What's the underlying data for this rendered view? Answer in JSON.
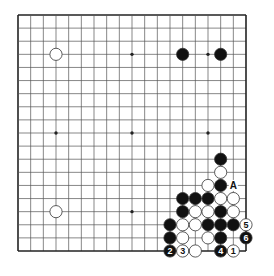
{
  "diagram": {
    "type": "go-board",
    "size": 19,
    "geometry": {
      "left": 18,
      "top": 15,
      "right": 246,
      "bottom": 251,
      "stone_radius": 6.1
    },
    "colors": {
      "line": "#555555",
      "edge": "#222222",
      "black": "#111111",
      "white": "#ffffff",
      "stone_outline": "#333333",
      "background": "#ffffff"
    },
    "star_points": [
      [
        3,
        3
      ],
      [
        9,
        3
      ],
      [
        15,
        3
      ],
      [
        3,
        9
      ],
      [
        9,
        9
      ],
      [
        15,
        9
      ],
      [
        3,
        15
      ],
      [
        9,
        15
      ],
      [
        15,
        15
      ]
    ],
    "stones": [
      {
        "color": "white",
        "col": 3,
        "row": 3
      },
      {
        "color": "black",
        "col": 13,
        "row": 3
      },
      {
        "color": "black",
        "col": 16,
        "row": 3
      },
      {
        "color": "white",
        "col": 3,
        "row": 15
      },
      {
        "color": "black",
        "col": 16,
        "row": 11
      },
      {
        "color": "white",
        "col": 16,
        "row": 12
      },
      {
        "color": "white",
        "col": 15,
        "row": 13
      },
      {
        "color": "black",
        "col": 16,
        "row": 13
      },
      {
        "color": "black",
        "col": 13,
        "row": 14
      },
      {
        "color": "black",
        "col": 14,
        "row": 14
      },
      {
        "color": "black",
        "col": 15,
        "row": 14
      },
      {
        "color": "white",
        "col": 16,
        "row": 14
      },
      {
        "color": "white",
        "col": 17,
        "row": 14
      },
      {
        "color": "black",
        "col": 13,
        "row": 15
      },
      {
        "color": "white",
        "col": 14,
        "row": 15
      },
      {
        "color": "white",
        "col": 15,
        "row": 15
      },
      {
        "color": "black",
        "col": 16,
        "row": 15
      },
      {
        "color": "white",
        "col": 17,
        "row": 15
      },
      {
        "color": "black",
        "col": 12,
        "row": 16
      },
      {
        "color": "white",
        "col": 13,
        "row": 16
      },
      {
        "color": "white",
        "col": 14,
        "row": 16
      },
      {
        "color": "black",
        "col": 15,
        "row": 16
      },
      {
        "color": "black",
        "col": 16,
        "row": 16
      },
      {
        "color": "black",
        "col": 17,
        "row": 16
      },
      {
        "color": "white",
        "col": 18,
        "row": 16,
        "label": "5"
      },
      {
        "color": "black",
        "col": 12,
        "row": 17
      },
      {
        "color": "white",
        "col": 13,
        "row": 17
      },
      {
        "color": "white",
        "col": 15,
        "row": 17
      },
      {
        "color": "black",
        "col": 16,
        "row": 17
      },
      {
        "color": "black",
        "col": 18,
        "row": 17,
        "label": "6"
      },
      {
        "color": "black",
        "col": 12,
        "row": 18,
        "label": "2"
      },
      {
        "color": "white",
        "col": 13,
        "row": 18,
        "label": "3"
      },
      {
        "color": "white",
        "col": 14,
        "row": 18
      },
      {
        "color": "black",
        "col": 16,
        "row": 18,
        "label": "4"
      },
      {
        "color": "white",
        "col": 17,
        "row": 18,
        "label": "1"
      }
    ],
    "marks": [
      {
        "text": "A",
        "col": 17,
        "row": 13
      }
    ]
  }
}
